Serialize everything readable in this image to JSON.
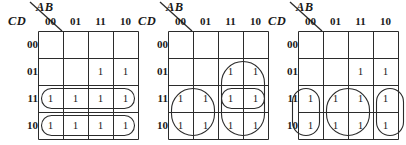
{
  "figure": {
    "type": "karnaugh-maps",
    "count": 3,
    "variables_top": "AB",
    "variables_side": "CD",
    "column_headers": [
      "00",
      "01",
      "11",
      "10"
    ],
    "row_headers": [
      "00",
      "01",
      "11",
      "10"
    ],
    "line_color": "#2b2b2b"
  },
  "maps": [
    {
      "id": "kmap-1",
      "x_offset": 0,
      "ab_label": "AB",
      "cd_label": "CD",
      "columns": [
        "00",
        "01",
        "11",
        "10"
      ],
      "rows": [
        "00",
        "01",
        "11",
        "10"
      ],
      "cells": [
        [
          "",
          "",
          "",
          ""
        ],
        [
          "",
          "",
          "1",
          "1"
        ],
        [
          "1",
          "1",
          "1",
          "1"
        ],
        [
          "1",
          "1",
          "1",
          "1"
        ]
      ],
      "groups": [
        {
          "name": "row-11-full",
          "col": 0,
          "row": 2,
          "cols": 4,
          "rows": 1,
          "clip_left": false,
          "clip_right": false
        },
        {
          "name": "row-10-full",
          "col": 0,
          "row": 3,
          "cols": 4,
          "rows": 1,
          "clip_left": false,
          "clip_right": false
        }
      ]
    },
    {
      "id": "kmap-2",
      "x_offset": 130,
      "ab_label": "AB",
      "cd_label": "CD",
      "columns": [
        "00",
        "01",
        "11",
        "10"
      ],
      "rows": [
        "00",
        "01",
        "11",
        "10"
      ],
      "cells": [
        [
          "",
          "",
          "",
          ""
        ],
        [
          "",
          "",
          "1",
          "1"
        ],
        [
          "1",
          "1",
          "1",
          "1"
        ],
        [
          "1",
          "1",
          "1",
          "1"
        ]
      ],
      "groups": [
        {
          "name": "quad-left-bottom",
          "col": 0,
          "row": 2,
          "cols": 2,
          "rows": 2,
          "clip_left": false,
          "clip_right": false
        },
        {
          "name": "six-right-tall",
          "col": 2,
          "row": 1,
          "cols": 2,
          "rows": 3,
          "clip_left": false,
          "clip_right": false
        },
        {
          "name": "pair-row-11-right",
          "col": 2,
          "row": 2,
          "cols": 2,
          "rows": 1,
          "clip_left": false,
          "clip_right": false
        }
      ]
    },
    {
      "id": "kmap-3",
      "x_offset": 260,
      "ab_label": "AB",
      "cd_label": "CD",
      "columns": [
        "00",
        "01",
        "11",
        "10"
      ],
      "rows": [
        "00",
        "01",
        "11",
        "10"
      ],
      "cells": [
        [
          "",
          "",
          "",
          ""
        ],
        [
          "",
          "",
          "1",
          "1"
        ],
        [
          "1",
          "1",
          "1",
          "1"
        ],
        [
          "1",
          "1",
          "1",
          "1"
        ]
      ],
      "groups": [
        {
          "name": "pair-col-00-wrap",
          "col": 0,
          "row": 2,
          "cols": 1,
          "rows": 2,
          "clip_left": true,
          "clip_right": false
        },
        {
          "name": "quad-col-01-11",
          "col": 1,
          "row": 2,
          "cols": 2,
          "rows": 2,
          "clip_left": false,
          "clip_right": false
        },
        {
          "name": "pair-col-10-wrap",
          "col": 3,
          "row": 2,
          "cols": 1,
          "rows": 2,
          "clip_left": false,
          "clip_right": true
        }
      ]
    }
  ]
}
